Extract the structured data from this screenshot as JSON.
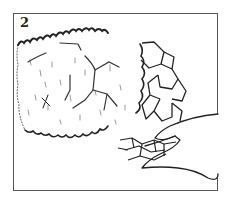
{
  "figure": {
    "step_number": "2",
    "colors": {
      "frame": "#555555",
      "ink": "#222222",
      "background": "#ffffff"
    }
  }
}
